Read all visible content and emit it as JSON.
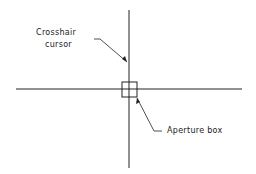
{
  "labels": {
    "crosshair_line1": "Crosshair",
    "crosshair_line2": "cursor",
    "aperture": "Aperture box"
  },
  "colors": {
    "line": "#222222",
    "background": "#ffffff"
  }
}
